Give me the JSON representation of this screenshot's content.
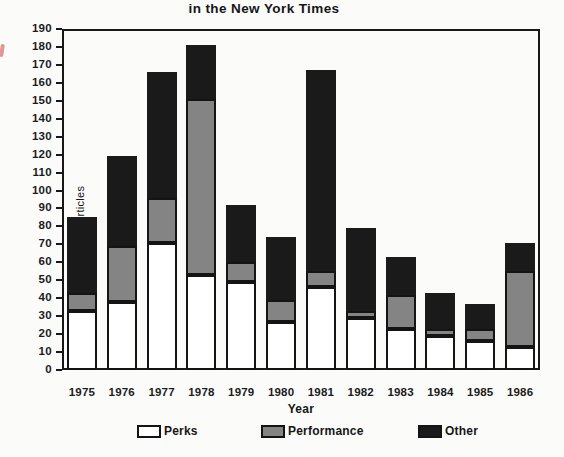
{
  "chart_data": {
    "type": "bar",
    "stacked": true,
    "title": "in the New York Times",
    "xlabel": "Year",
    "ylabel": "Number of articles",
    "ylim": [
      0,
      190
    ],
    "ytick_step": 10,
    "grid": false,
    "legend_position": "bottom",
    "categories": [
      "1975",
      "1976",
      "1977",
      "1978",
      "1979",
      "1980",
      "1981",
      "1982",
      "1983",
      "1984",
      "1985",
      "1986"
    ],
    "series": [
      {
        "name": "Perks",
        "color": "#ffffff",
        "values": [
          33,
          38,
          71,
          53,
          49,
          27,
          46,
          29,
          23,
          19,
          16,
          13
        ]
      },
      {
        "name": "Performance",
        "color": "#848484",
        "values": [
          10,
          31,
          25,
          98,
          11,
          12,
          9,
          4,
          19,
          4,
          7,
          42
        ]
      },
      {
        "name": "Other",
        "color": "#1a1a1a",
        "values": [
          42,
          50,
          70,
          30,
          32,
          35,
          112,
          46,
          21,
          20,
          14,
          16
        ]
      }
    ],
    "totals": [
      85,
      119,
      166,
      181,
      92,
      74,
      167,
      79,
      63,
      43,
      37,
      71
    ],
    "colors": {
      "frame": "#181818",
      "text": "#161616",
      "paper": "#fbfbfa"
    }
  }
}
